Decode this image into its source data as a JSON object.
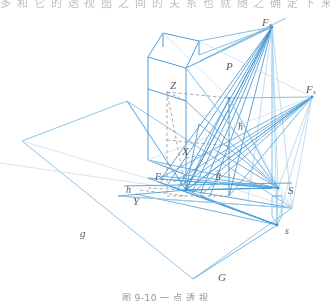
{
  "page": {
    "top_cut_text": "多 和 它 的 透 视  图 之 间 的 关 系 也 就 随 之 确 定 下 来",
    "caption": "图 9-10   一 点 透 视"
  },
  "figure": {
    "type": "perspective-projection-diagram",
    "colors": {
      "line_primary": "#3f93d4",
      "line_secondary": "#8fc4e8",
      "line_faint": "#b9d9f0",
      "dashed": "#8d8b8c",
      "label": "#4a4a52",
      "background": "#ffffff"
    },
    "labels": [
      {
        "id": "F-top",
        "text": "F",
        "sub": "z",
        "tilde": false,
        "x": 262,
        "y": 17,
        "size": 11
      },
      {
        "id": "F-right",
        "text": "F",
        "sub": "x",
        "tilde": false,
        "x": 306,
        "y": 84,
        "size": 11
      },
      {
        "id": "P",
        "text": "P",
        "sub": "",
        "tilde": false,
        "x": 226,
        "y": 61,
        "size": 11
      },
      {
        "id": "Z",
        "text": "Z",
        "sub": "",
        "tilde": false,
        "x": 170,
        "y": 80,
        "size": 11
      },
      {
        "id": "h-right",
        "text": "h",
        "sub": "",
        "tilde": true,
        "x": 238,
        "y": 122,
        "size": 10
      },
      {
        "id": "X",
        "text": "X",
        "sub": "",
        "tilde": false,
        "x": 182,
        "y": 146,
        "size": 11
      },
      {
        "id": "g-mid",
        "text": "g",
        "sub": "",
        "tilde": true,
        "x": 216,
        "y": 170,
        "size": 10
      },
      {
        "id": "F-left",
        "text": "F",
        "sub": "y",
        "tilde": false,
        "x": 155,
        "y": 172,
        "size": 10
      },
      {
        "id": "h-left",
        "text": "h",
        "sub": "",
        "tilde": false,
        "x": 126,
        "y": 185,
        "size": 10
      },
      {
        "id": "Y",
        "text": "Y",
        "sub": "",
        "tilde": false,
        "x": 133,
        "y": 196,
        "size": 11
      },
      {
        "id": "S-upper",
        "text": "S",
        "sub": "",
        "tilde": false,
        "x": 288,
        "y": 185,
        "size": 11
      },
      {
        "id": "s-lower",
        "text": "s",
        "sub": "",
        "tilde": false,
        "x": 285,
        "y": 226,
        "size": 10
      },
      {
        "id": "g-left",
        "text": "g",
        "sub": "",
        "tilde": false,
        "x": 80,
        "y": 228,
        "size": 11
      },
      {
        "id": "G",
        "text": "G",
        "sub": "",
        "tilde": false,
        "x": 218,
        "y": 272,
        "size": 11
      }
    ],
    "geometry": {
      "ground_plane": "22,141 127,101 292,208 193,279",
      "picture_plane_slant": "148,55 163,32 198,40 186,68",
      "vertical_wall": "148,55 186,68 186,180 148,160",
      "station_point_upper": [
        278,
        188
      ],
      "station_point_lower": [
        277,
        225
      ],
      "vanishing_point_z": [
        272,
        27
      ],
      "vanishing_point_x": [
        312,
        97
      ],
      "center_point": [
        186,
        190
      ]
    }
  }
}
